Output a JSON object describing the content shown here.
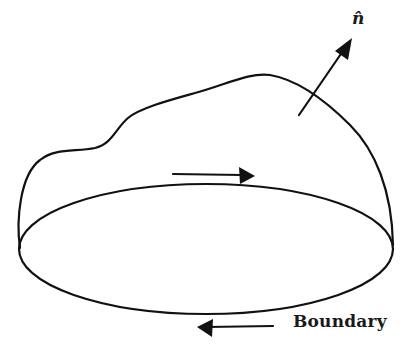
{
  "figure": {
    "labels": {
      "boundary": "Boundary",
      "normal": "n̂"
    },
    "colors": {
      "stroke": "#111111",
      "background": "#ffffff"
    },
    "elements": [
      {
        "name": "surface-outline",
        "kind": "curve"
      },
      {
        "name": "boundary-ellipse",
        "kind": "ellipse"
      },
      {
        "name": "normal-vector-arrow",
        "kind": "arrow",
        "direction": "up-right"
      },
      {
        "name": "circulation-arrow-top",
        "kind": "arrow",
        "direction": "right"
      },
      {
        "name": "circulation-arrow-bottom",
        "kind": "arrow",
        "direction": "left"
      }
    ]
  }
}
